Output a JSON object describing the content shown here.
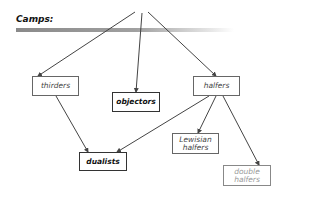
{
  "title": "Camps:",
  "nodes": {
    "thirders": {
      "label": "thirders"
    },
    "objectors": {
      "label": "objectors"
    },
    "halfers": {
      "label": "halfers"
    },
    "dualists": {
      "label": "dualists"
    },
    "lewisian_halfers": {
      "label": "Lewisian halfers"
    },
    "double_halfers": {
      "label": "double halfers"
    }
  },
  "edges": [
    {
      "from": "root",
      "to": "thirders"
    },
    {
      "from": "root",
      "to": "objectors"
    },
    {
      "from": "root",
      "to": "halfers"
    },
    {
      "from": "thirders",
      "to": "dualists"
    },
    {
      "from": "halfers",
      "to": "dualists"
    },
    {
      "from": "halfers",
      "to": "lewisian_halfers"
    },
    {
      "from": "halfers",
      "to": "double_halfers"
    }
  ],
  "colors": {
    "line": "#444444",
    "bar": "#8a8a8a",
    "faded_text": "#999999"
  }
}
